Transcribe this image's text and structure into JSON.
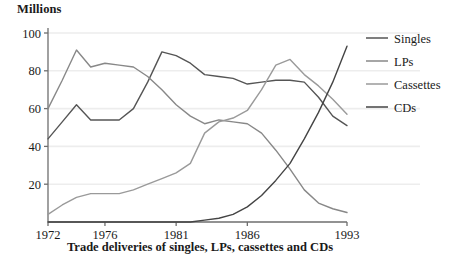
{
  "chart_data": {
    "type": "line",
    "title": "Trade deliveries of singles, LPs, cassettes and CDs",
    "ylabel": "Millions",
    "xlabel": "",
    "ylim": [
      0,
      100
    ],
    "xlim": [
      1972,
      1993
    ],
    "grid": true,
    "legend_position": "right",
    "ytick_labels": [
      "100",
      "80",
      "60",
      "40",
      "20"
    ],
    "yticks": [
      100,
      80,
      60,
      40,
      20
    ],
    "xtick_labels": [
      "1972",
      "1976",
      "1981",
      "1986",
      "1993"
    ],
    "xticks": [
      1972,
      1976,
      1981,
      1986,
      1993
    ],
    "x": [
      1972,
      1973,
      1974,
      1975,
      1976,
      1977,
      1978,
      1979,
      1980,
      1981,
      1982,
      1983,
      1984,
      1985,
      1986,
      1987,
      1988,
      1989,
      1990,
      1991,
      1992,
      1993
    ],
    "series": [
      {
        "name": "Singles",
        "color": "#555555",
        "values": [
          44,
          53,
          62,
          54,
          54,
          54,
          60,
          74,
          90,
          88,
          84,
          78,
          77,
          76,
          73,
          74,
          75,
          75,
          74,
          66,
          56,
          51
        ]
      },
      {
        "name": "LPs",
        "color": "#888888",
        "values": [
          60,
          75,
          91,
          82,
          84,
          83,
          82,
          77,
          70,
          62,
          56,
          52,
          54,
          53,
          52,
          47,
          38,
          28,
          17,
          10,
          7,
          5
        ]
      },
      {
        "name": "Cassettes",
        "color": "#9a9a9a",
        "values": [
          4,
          9,
          13,
          15,
          15,
          15,
          17,
          20,
          23,
          26,
          31,
          47,
          53,
          55,
          59,
          70,
          83,
          86,
          78,
          72,
          65,
          57
        ]
      },
      {
        "name": "CDs",
        "color": "#444444",
        "values": [
          0,
          0,
          0,
          0,
          0,
          0,
          0,
          0,
          0,
          0,
          0,
          1,
          2,
          4,
          8,
          14,
          22,
          31,
          44,
          58,
          74,
          93
        ]
      }
    ]
  },
  "legend": {
    "items": [
      {
        "label": "Singles"
      },
      {
        "label": "LPs"
      },
      {
        "label": "Cassettes"
      },
      {
        "label": "CDs"
      }
    ]
  },
  "colors": {
    "axis": "#6e6e6e",
    "grid": "#ededed",
    "text": "#1a1a1a",
    "background": "#ffffff"
  }
}
